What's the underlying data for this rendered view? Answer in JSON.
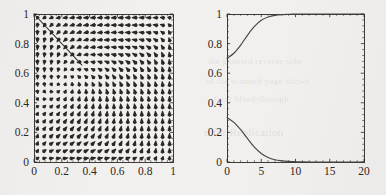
{
  "figure": {
    "background_color": "#f2f0ee",
    "ink_color": "#2c2722",
    "panel_count": 2
  },
  "ghost_text": [
    {
      "text": "the ghosted reverse side",
      "x": 208,
      "y": 62,
      "size": 9
    },
    {
      "text": "of the scanned page shows",
      "x": 206,
      "y": 82,
      "size": 9
    },
    {
      "text": "faint bleed-through",
      "x": 214,
      "y": 100,
      "size": 9
    },
    {
      "text": "n for Replication",
      "x": 204,
      "y": 132,
      "size": 11
    }
  ],
  "chart_data": [
    {
      "type": "quiver",
      "title": "",
      "xlabel": "",
      "ylabel": "",
      "xlim": [
        0,
        1
      ],
      "ylim": [
        0,
        1
      ],
      "xticks": [
        0,
        0.2,
        0.4,
        0.6,
        0.8,
        1
      ],
      "xticklabels": [
        "0",
        "0.2",
        "0.4",
        "0.6",
        "0.8",
        "1"
      ],
      "yticks": [
        0,
        0.2,
        0.4,
        0.6,
        0.8,
        1
      ],
      "yticklabels": [
        "0",
        "0.2",
        "0.4",
        "0.6",
        "0.8",
        "1"
      ],
      "grid": false,
      "frame": true,
      "arrow_grid": {
        "nx": 20,
        "ny": 20
      },
      "description": "Direction field of a planar replicator system on the unit square; arrows flow away from an interior saddle near (0.33,0.62) toward the corners (1,1) and (1,0).",
      "annotations": [
        {
          "kind": "line",
          "name": "separatrix",
          "points": [
            [
              0.0,
              1.0
            ],
            [
              0.345,
              0.655
            ]
          ],
          "description": "straight separatrix segment from the upper-left corner to the interior equilibrium"
        }
      ],
      "equilibrium": [
        0.345,
        0.655
      ]
    },
    {
      "type": "line",
      "title": "",
      "xlabel": "",
      "ylabel": "",
      "xlim": [
        0,
        20
      ],
      "ylim": [
        0,
        1
      ],
      "xticks": [
        0,
        5,
        10,
        15,
        20
      ],
      "xticklabels": [
        "0",
        "5",
        "10",
        "15",
        "20"
      ],
      "yticks": [
        0,
        0.2,
        0.4,
        0.6,
        0.8,
        1
      ],
      "yticklabels": [
        "0",
        "0.2",
        "0.4",
        "0.6",
        "0.8",
        "1"
      ],
      "grid": false,
      "frame": true,
      "legend": false,
      "x": [
        0,
        1,
        2,
        3,
        4,
        5,
        6,
        7,
        8,
        9,
        10,
        11,
        12,
        13,
        14,
        15,
        16,
        17,
        18,
        19,
        20
      ],
      "series": [
        {
          "name": "upper-trajectory",
          "values": [
            0.7,
            0.735,
            0.79,
            0.857,
            0.916,
            0.958,
            0.98,
            0.991,
            0.996,
            0.998,
            0.999,
            1.0,
            1.0,
            1.0,
            1.0,
            1.0,
            1.0,
            1.0,
            1.0,
            1.0,
            1.0
          ]
        },
        {
          "name": "lower-trajectory",
          "values": [
            0.3,
            0.268,
            0.218,
            0.158,
            0.1,
            0.057,
            0.03,
            0.015,
            0.008,
            0.004,
            0.002,
            0.001,
            0.0,
            0.0,
            0.0,
            0.0,
            0.0,
            0.0,
            0.0,
            0.0,
            0.0
          ]
        }
      ],
      "description": "Two time-courses starting at 0.70 and 0.30 that saturate at 1 and 0 respectively."
    }
  ]
}
